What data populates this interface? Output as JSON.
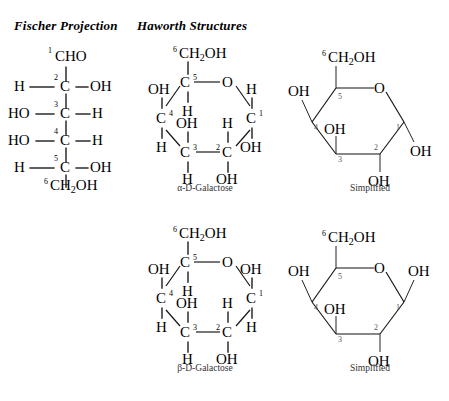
{
  "headers": {
    "fischer": "Fischer Projection",
    "haworth": "Haworth Structures"
  },
  "captions": {
    "alpha": "α-D-Galactose",
    "beta": "β-D-Galactose",
    "simplified": "Simplified"
  },
  "labels": {
    "CHO": "CHO",
    "C": "C",
    "H": "H",
    "OH": "OH",
    "HO": "HO",
    "O": "O",
    "CH": "CH",
    "two": "2",
    "n1": "1",
    "n2": "2",
    "n3": "3",
    "n4": "4",
    "n5": "5",
    "n6": "6"
  },
  "fischer": {
    "title": "D-Galactose Fischer projection",
    "top_group": "CHO",
    "bottom_group": "CH2OH",
    "centers": [
      {
        "number": "2",
        "left": "H",
        "right": "OH"
      },
      {
        "number": "3",
        "left": "HO",
        "right": "H"
      },
      {
        "number": "4",
        "left": "HO",
        "right": "H"
      },
      {
        "number": "5",
        "left": "H",
        "right": "OH"
      }
    ]
  },
  "haworth": {
    "alpha": {
      "name": "α-D-Galactose",
      "ring_oxygen": "O",
      "substituents": [
        {
          "carbon": "1",
          "up": "H",
          "down": "OH"
        },
        {
          "carbon": "2",
          "up": "H",
          "down": "OH"
        },
        {
          "carbon": "3",
          "up": "OH",
          "down": "H"
        },
        {
          "carbon": "4",
          "up": "OH",
          "down": "H"
        },
        {
          "carbon": "5",
          "up": "CH2OH",
          "down": "H"
        }
      ]
    },
    "beta": {
      "name": "β-D-Galactose",
      "ring_oxygen": "O",
      "substituents": [
        {
          "carbon": "1",
          "up": "OH",
          "down": "H"
        },
        {
          "carbon": "2",
          "up": "H",
          "down": "OH"
        },
        {
          "carbon": "3",
          "up": "OH",
          "down": "H"
        },
        {
          "carbon": "4",
          "up": "OH",
          "down": "H"
        },
        {
          "carbon": "5",
          "up": "CH2OH",
          "down": "H"
        }
      ]
    }
  },
  "simplified": {
    "alpha": {
      "caption": "Simplified",
      "substituents": [
        {
          "carbon": "1",
          "group": "OH",
          "direction": "down"
        },
        {
          "carbon": "2",
          "group": "OH",
          "direction": "down"
        },
        {
          "carbon": "3",
          "group": "OH",
          "direction": "up"
        },
        {
          "carbon": "4",
          "group": "OH",
          "direction": "up"
        },
        {
          "carbon": "5",
          "group": "CH2OH",
          "direction": "up"
        }
      ]
    },
    "beta": {
      "caption": "Simplified",
      "substituents": [
        {
          "carbon": "1",
          "group": "OH",
          "direction": "up"
        },
        {
          "carbon": "2",
          "group": "OH",
          "direction": "down"
        },
        {
          "carbon": "3",
          "group": "OH",
          "direction": "up"
        },
        {
          "carbon": "4",
          "group": "OH",
          "direction": "up"
        },
        {
          "carbon": "5",
          "group": "CH2OH",
          "direction": "up"
        }
      ]
    }
  },
  "colors": {
    "ink": "#000000",
    "caption": "#333333",
    "background": "#ffffff"
  }
}
